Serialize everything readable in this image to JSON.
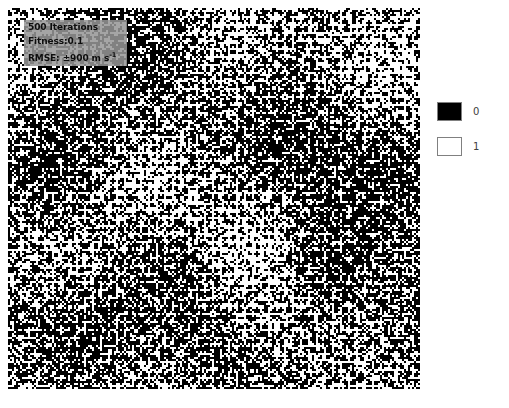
{
  "figure": {
    "kind": "binary-raster-map",
    "background_color": "#ffffff",
    "raster": {
      "x": 8,
      "y": 8,
      "width": 412,
      "height": 381,
      "cols": 206,
      "rows": 190,
      "cell_px": 2,
      "value_colors": {
        "0": "#000000",
        "1": "#ffffff"
      },
      "description": "Dense black-and-white binary cell grid with repeating diamond, cross and ring motifs; several darker diamond-shaped clusters appear across the field."
    }
  },
  "annotation": {
    "background_color": "#969696",
    "text_color": "#0d0d0d",
    "line1": "500 Iterations",
    "line2": "Fitness:0.1",
    "line3_prefix": "RMSE: ±900 m s",
    "line3_unit_exponent": "-1",
    "full_line3": "RMSE: ±900 m s-1"
  },
  "legend": {
    "border_color": "#808080",
    "label_color": "#404040",
    "items": [
      {
        "value_label": "0",
        "swatch_color": "#000000",
        "name": "legend-swatch-zero"
      },
      {
        "value_label": "1",
        "swatch_color": "#ffffff",
        "name": "legend-swatch-one"
      }
    ]
  },
  "chart_data": {
    "type": "heatmap",
    "title": "",
    "xlabel": "",
    "ylabel": "",
    "categories": [
      "0",
      "1"
    ],
    "legend_entries": [
      "0",
      "1"
    ],
    "legend_position": "right",
    "grid": false,
    "colormap": {
      "0": "#000000",
      "1": "#ffffff"
    },
    "value_domain": [
      0,
      1
    ],
    "grid_shape": {
      "cols": 206,
      "rows": 190
    },
    "annotations": [
      "500 Iterations",
      "Fitness:0.1",
      "RMSE: ±900 m s-1"
    ],
    "metrics": {
      "iterations": 500,
      "fitness": 0.1,
      "rmse_value": 900,
      "rmse_sign": "±",
      "rmse_units": "m s-1"
    }
  }
}
